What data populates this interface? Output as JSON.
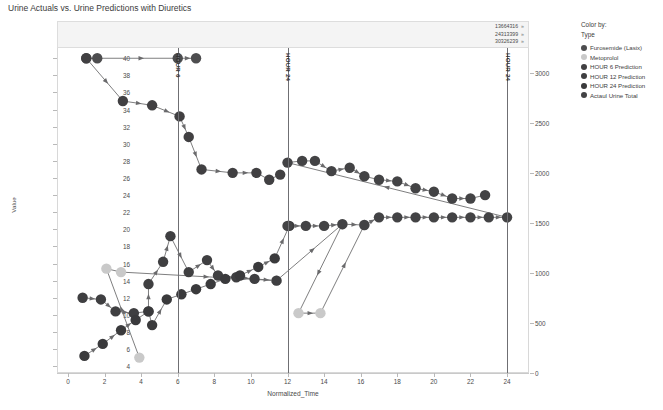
{
  "chart_data": {
    "type": "scatter",
    "title": "Urine Actuals vs. Urine Predictions with Diuretics",
    "xlabel": "Normalized_Time",
    "ylabel": "Value",
    "xlim": [
      -0.6,
      25.2
    ],
    "ylim": [
      3.2,
      41.2
    ],
    "y2lim": [
      0,
      3250
    ],
    "grid": false,
    "legend_position": "right",
    "xticks": [
      0,
      2,
      4,
      6,
      8,
      10,
      12,
      14,
      16,
      18,
      20,
      22,
      24
    ],
    "yticks": [
      4,
      6,
      8,
      10,
      12,
      14,
      16,
      18,
      20,
      22,
      24,
      26,
      28,
      30,
      32,
      34,
      36,
      38,
      40
    ],
    "y2ticks": [
      0,
      500,
      1000,
      1500,
      2000,
      2500,
      3000
    ],
    "reference_lines": [
      {
        "name": "HOUR 6",
        "x": 6,
        "label": "HOUR 6"
      },
      {
        "name": "HOUR 24 mid",
        "x": 12,
        "label": "HOUR 24"
      },
      {
        "name": "HOUR 24 end",
        "x": 24,
        "label": "HOUR 24"
      }
    ],
    "header_ids": [
      "13664316",
      "24313399",
      "30326239"
    ],
    "series": [
      {
        "name": "Furosemide (Lasix)",
        "color": "#4d4d4f",
        "points": [
          [
            1.0,
            40.0
          ],
          [
            1.6,
            40.0
          ],
          [
            6.0,
            40.0
          ],
          [
            7.0,
            40.0
          ]
        ]
      },
      {
        "name": "Metoprolol",
        "color": "#c9c9c9",
        "points": [
          [
            3.9,
            5.0
          ],
          [
            2.1,
            15.4
          ],
          [
            2.9,
            15.0
          ],
          [
            11.4,
            14.0
          ],
          [
            15.0,
            20.6
          ],
          [
            12.6,
            10.2
          ],
          [
            13.8,
            10.2
          ],
          [
            16.2,
            20.5
          ]
        ]
      },
      {
        "name": "HOUR 6 Prediction",
        "color": "#414042",
        "points": [
          [
            1.0,
            40.0
          ],
          [
            3.0,
            35.0
          ],
          [
            4.6,
            34.5
          ],
          [
            6.1,
            33.2
          ],
          [
            6.6,
            30.8
          ],
          [
            7.3,
            27.0
          ],
          [
            9.0,
            26.6
          ],
          [
            10.3,
            26.6
          ],
          [
            11.0,
            25.8
          ],
          [
            11.6,
            26.4
          ]
        ]
      },
      {
        "name": "HOUR 12 Prediction",
        "color": "#3f3f41",
        "points": [
          [
            0.8,
            12.0
          ],
          [
            1.8,
            11.8
          ],
          [
            2.6,
            10.4
          ],
          [
            3.6,
            10.2
          ],
          [
            4.4,
            10.4
          ],
          [
            4.4,
            13.6
          ],
          [
            5.2,
            16.2
          ],
          [
            5.6,
            19.2
          ],
          [
            6.6,
            15.0
          ],
          [
            7.6,
            16.4
          ],
          [
            8.2,
            14.6
          ],
          [
            9.2,
            14.4
          ],
          [
            10.2,
            14.2
          ],
          [
            11.4,
            14.0
          ]
        ]
      },
      {
        "name": "HOUR 24 Prediction",
        "color": "#3a3a3c",
        "points": [
          [
            0.9,
            5.2
          ],
          [
            1.9,
            6.6
          ],
          [
            2.9,
            8.2
          ],
          [
            3.7,
            9.4
          ],
          [
            4.4,
            10.4
          ],
          [
            4.6,
            8.8
          ],
          [
            5.4,
            11.8
          ],
          [
            6.2,
            12.4
          ],
          [
            7.0,
            13.0
          ],
          [
            7.8,
            13.6
          ],
          [
            8.6,
            14.2
          ],
          [
            9.4,
            14.6
          ],
          [
            10.4,
            15.6
          ],
          [
            11.3,
            16.6
          ],
          [
            12.1,
            20.4
          ]
        ]
      },
      {
        "name": "Actaul Urine Total",
        "color": "#434345",
        "points": [
          [
            12.0,
            20.4
          ],
          [
            13.0,
            20.4
          ],
          [
            14.0,
            20.4
          ],
          [
            15.0,
            20.6
          ],
          [
            16.2,
            20.5
          ],
          [
            17.0,
            21.4
          ],
          [
            18.0,
            21.4
          ],
          [
            19.0,
            21.4
          ],
          [
            20.0,
            21.4
          ],
          [
            21.0,
            21.4
          ],
          [
            22.0,
            21.4
          ],
          [
            23.0,
            21.4
          ],
          [
            24.0,
            21.4
          ],
          [
            12.0,
            27.8
          ],
          [
            12.8,
            28.0
          ],
          [
            13.5,
            28.0
          ],
          [
            14.4,
            26.8
          ],
          [
            15.4,
            27.2
          ],
          [
            16.2,
            26.2
          ],
          [
            17.0,
            25.8
          ],
          [
            18.0,
            25.6
          ],
          [
            19.0,
            24.8
          ],
          [
            20.0,
            24.4
          ],
          [
            21.0,
            23.6
          ],
          [
            22.0,
            23.6
          ],
          [
            22.8,
            24.0
          ]
        ]
      }
    ]
  },
  "legend": {
    "title_line1": "Color by:",
    "title_line2": "Type",
    "items": [
      {
        "label": "Furosemide (Lasix)",
        "color": "#4d4d4f"
      },
      {
        "label": "Metoprolol",
        "color": "#c9c9c9"
      },
      {
        "label": "HOUR 6 Prediction",
        "color": "#414042"
      },
      {
        "label": "HOUR 12 Prediction",
        "color": "#3f3f41"
      },
      {
        "label": "HOUR 24 Prediction",
        "color": "#3a3a3c"
      },
      {
        "label": "Actaul Urine Total",
        "color": "#434345"
      }
    ]
  }
}
